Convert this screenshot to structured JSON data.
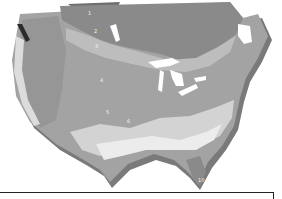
{
  "map": {
    "title": "",
    "type": "plant hardiness zone map (grayscale, 3D extruded)",
    "region": "North America (United States and southern Canada)",
    "colors": {
      "background": "#ffffff",
      "zone_darkest": "#6f6f6f",
      "zone_dark": "#8a8a8a",
      "zone_mid": "#a3a3a3",
      "zone_light": "#bdbdbd",
      "zone_lighter": "#d3d3d3",
      "zone_lightest": "#ececec",
      "coast_wall": "#7a7a7a",
      "lakes": "#ffffff",
      "frame": "#222222"
    },
    "zone_labels": [
      {
        "text": "1",
        "x": 88,
        "y": 13
      },
      {
        "text": "2",
        "x": 94,
        "y": 31
      },
      {
        "text": "3",
        "x": 95,
        "y": 46
      },
      {
        "text": "4",
        "x": 100,
        "y": 80
      },
      {
        "text": "5",
        "x": 106,
        "y": 112
      },
      {
        "text": "6",
        "x": 127,
        "y": 121
      },
      {
        "text": "10",
        "x": 199,
        "y": 180
      }
    ],
    "features": [
      "Great Lakes",
      "Rocky Mountains relief",
      "Gulf coast",
      "Florida peninsula",
      "Atlantic coast",
      "Maritime provinces"
    ]
  }
}
